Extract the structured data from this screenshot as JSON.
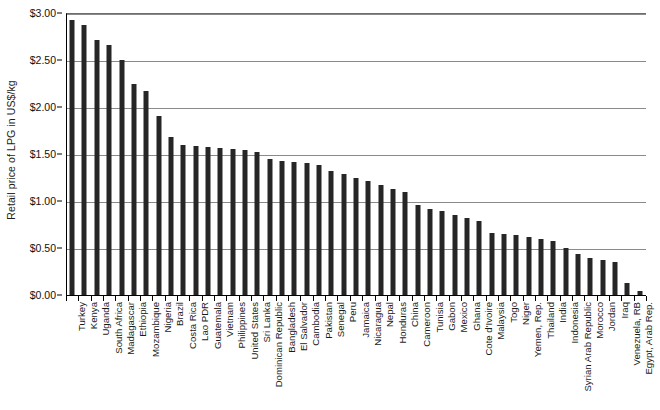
{
  "chart_data": {
    "type": "bar",
    "title": "",
    "subtitle": "",
    "xlabel": "",
    "ylabel": "Retail price of LPG in US$/kg",
    "ylim": [
      0,
      3.0
    ],
    "ytick_values": [
      0,
      0.5,
      1.0,
      1.5,
      2.0,
      2.5,
      3.0
    ],
    "ytick_labels": [
      "$0.00",
      "$0.50",
      "$1.00",
      "$1.50",
      "$2.00",
      "$2.50",
      "$3.00"
    ],
    "grid": "horizontal",
    "legend": "none",
    "bar_color": "#262626",
    "categories": [
      "Turkey",
      "Kenya",
      "Uganda",
      "South Africa",
      "Madagascar",
      "Ethiopia",
      "Mozambique",
      "Nigeria",
      "Brazil",
      "Costa Rica",
      "Lao PDR",
      "Guatemala",
      "Vietnam",
      "Philippines",
      "United States",
      "Sri Lanka",
      "Dominican Republic",
      "Bangladesh",
      "El Salvador",
      "Cambodia",
      "Pakistan",
      "Senegal",
      "Peru",
      "Jamaica",
      "Nicaragua",
      "Nepal",
      "Honduras",
      "China",
      "Cameroon",
      "Tunisia",
      "Gabon",
      "Mexico",
      "Ghana",
      "Cote d'Ivoire",
      "Malaysia",
      "Togo",
      "Niger",
      "Yemen, Rep.",
      "Thailand",
      "India",
      "Indonesia",
      "Syrian Arab Republic",
      "Morocco",
      "Jordan",
      "Iraq",
      "Venezuela, RB",
      "Egypt, Arab Rep."
    ],
    "values": [
      2.93,
      2.87,
      2.71,
      2.66,
      2.5,
      2.24,
      2.17,
      1.9,
      1.68,
      1.6,
      1.58,
      1.57,
      1.56,
      1.55,
      1.54,
      1.52,
      1.45,
      1.43,
      1.42,
      1.4,
      1.38,
      1.32,
      1.29,
      1.25,
      1.21,
      1.17,
      1.13,
      1.1,
      0.96,
      0.91,
      0.89,
      0.85,
      0.82,
      0.79,
      0.66,
      0.65,
      0.64,
      0.62,
      0.6,
      0.57,
      0.5,
      0.44,
      0.39,
      0.37,
      0.35,
      0.13,
      0.04
    ]
  }
}
